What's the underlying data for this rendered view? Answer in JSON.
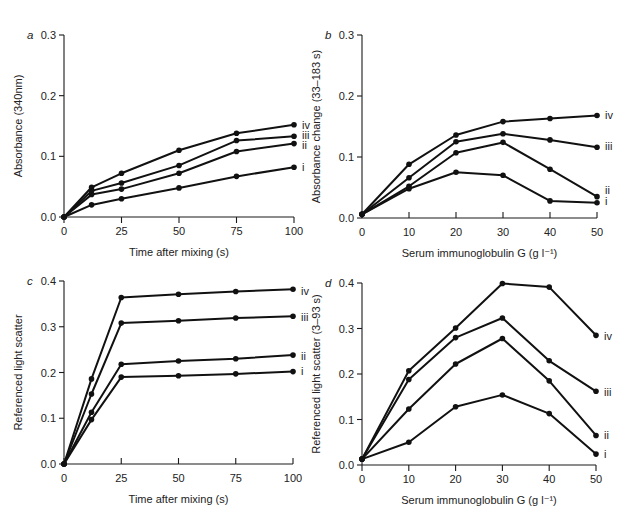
{
  "chart_data": [
    {
      "panel": "a",
      "type": "line",
      "title": "",
      "xlabel": "Time after mixing (s)",
      "ylabel": "Absorbance (340nm)",
      "xlim": [
        0,
        100
      ],
      "ylim": [
        0,
        0.3
      ],
      "xticks": [
        0,
        25,
        50,
        75,
        100
      ],
      "yticks": [
        "0.0",
        "0.1",
        "0.2",
        "0.3"
      ],
      "x": [
        0,
        12,
        25,
        50,
        75,
        100
      ],
      "series": [
        {
          "name": "iv",
          "values": [
            0,
            0.049,
            0.072,
            0.11,
            0.138,
            0.152
          ]
        },
        {
          "name": "iii",
          "values": [
            0,
            0.043,
            0.056,
            0.085,
            0.126,
            0.133
          ]
        },
        {
          "name": "ii",
          "values": [
            0,
            0.037,
            0.046,
            0.072,
            0.108,
            0.121
          ]
        },
        {
          "name": "i",
          "values": [
            0,
            0.02,
            0.03,
            0.048,
            0.067,
            0.082
          ]
        }
      ],
      "grid": false,
      "legend": "inline labels at right end of each line"
    },
    {
      "panel": "b",
      "type": "line",
      "title": "",
      "xlabel": "Serum immunoglobulin G (g l⁻¹)",
      "ylabel": "Absorbance change (33–183 s)",
      "xlim": [
        0,
        50
      ],
      "ylim": [
        0,
        0.3
      ],
      "xticks": [
        0,
        10,
        20,
        30,
        40,
        50
      ],
      "yticks": [
        "0.0",
        "0.1",
        "0.2",
        "0.3"
      ],
      "x": [
        0,
        10,
        20,
        30,
        40,
        50
      ],
      "series": [
        {
          "name": "iv",
          "values": [
            0.006,
            0.088,
            0.136,
            0.158,
            0.163,
            0.168
          ]
        },
        {
          "name": "iii",
          "values": [
            0.006,
            0.066,
            0.125,
            0.138,
            0.128,
            0.116
          ]
        },
        {
          "name": "ii",
          "values": [
            0.006,
            0.052,
            0.107,
            0.124,
            0.08,
            0.035
          ]
        },
        {
          "name": "i",
          "values": [
            0.006,
            0.048,
            0.075,
            0.07,
            0.028,
            0.025
          ]
        }
      ],
      "grid": false,
      "legend": "inline labels at right end of each line"
    },
    {
      "panel": "c",
      "type": "line",
      "title": "",
      "xlabel": "Time after mixing (s)",
      "ylabel": "Referenced light scatter",
      "xlim": [
        0,
        100
      ],
      "ylim": [
        0,
        0.4
      ],
      "xticks": [
        0,
        25,
        50,
        75,
        100
      ],
      "yticks": [
        "0.0",
        "0.1",
        "0.2",
        "0.3",
        "0.4"
      ],
      "x": [
        0,
        12,
        25,
        50,
        75,
        100
      ],
      "series": [
        {
          "name": "iv",
          "values": [
            0,
            0.186,
            0.364,
            0.371,
            0.377,
            0.382
          ]
        },
        {
          "name": "iii",
          "values": [
            0,
            0.153,
            0.308,
            0.313,
            0.319,
            0.323
          ]
        },
        {
          "name": "ii",
          "values": [
            0,
            0.113,
            0.218,
            0.225,
            0.23,
            0.238
          ]
        },
        {
          "name": "i",
          "values": [
            0,
            0.097,
            0.19,
            0.193,
            0.197,
            0.202
          ]
        }
      ],
      "grid": false,
      "legend": "inline labels at right end of each line"
    },
    {
      "panel": "d",
      "type": "line",
      "title": "",
      "xlabel": "Serum immunoglobulin G (g l⁻¹)",
      "ylabel": "Referenced light scatter (3–93 s)",
      "xlim": [
        0,
        50
      ],
      "ylim": [
        0,
        0.4
      ],
      "xticks": [
        0,
        10,
        20,
        30,
        40,
        50
      ],
      "yticks": [
        "0.0",
        "0.1",
        "0.2",
        "0.3",
        "0.4"
      ],
      "x": [
        0,
        10,
        20,
        30,
        40,
        50
      ],
      "series": [
        {
          "name": "iv",
          "values": [
            0.013,
            0.207,
            0.301,
            0.399,
            0.391,
            0.285
          ]
        },
        {
          "name": "iii",
          "values": [
            0.013,
            0.188,
            0.28,
            0.323,
            0.229,
            0.162
          ]
        },
        {
          "name": "ii",
          "values": [
            0.013,
            0.123,
            0.222,
            0.278,
            0.185,
            0.065
          ]
        },
        {
          "name": "i",
          "values": [
            0.013,
            0.05,
            0.128,
            0.154,
            0.113,
            0.024
          ]
        }
      ],
      "grid": false,
      "legend": "inline labels at right end of each line"
    }
  ],
  "layout": {
    "panels": [
      {
        "x0": 64,
        "x1": 294,
        "y0": 217,
        "y1": 35,
        "tickDir": "down",
        "labelOffsets": {
          "iv": 125,
          "iii": 135,
          "ii": 145,
          "i": 167
        }
      },
      {
        "x0": 362,
        "x1": 597,
        "y0": 218,
        "y1": 35,
        "tickDir": "up",
        "labelOffsets": {
          "iv": 115,
          "iii": 146,
          "ii": 190,
          "i": 201
        }
      },
      {
        "x0": 64,
        "x1": 293,
        "y0": 464,
        "y1": 281,
        "tickDir": "up",
        "labelOffsets": {
          "iv": 291,
          "iii": 317,
          "ii": 356,
          "i": 371
        }
      },
      {
        "x0": 362,
        "x1": 596,
        "y0": 465,
        "y1": 283,
        "tickDir": "down",
        "labelOffsets": {
          "iv": 336,
          "iii": 392,
          "ii": 435,
          "i": 454
        }
      }
    ]
  }
}
